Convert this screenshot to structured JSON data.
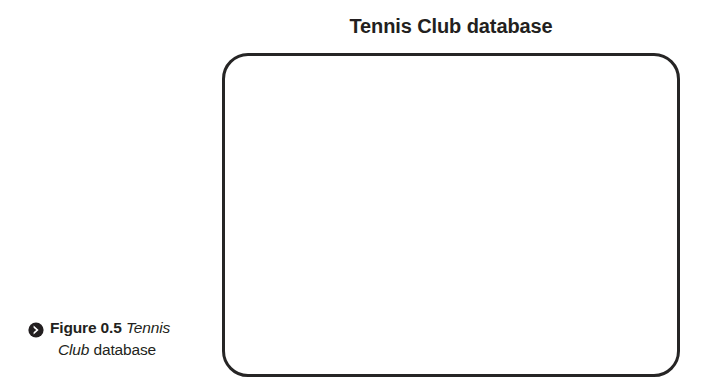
{
  "figure": {
    "title": "Tennis Club database",
    "frame": {
      "shape": "rounded-rectangle",
      "fill": "#ffffff",
      "stroke_color": "#262525",
      "stroke_width_px": 3.5,
      "corner_radius_px": 26,
      "contents": ""
    },
    "caption": {
      "icon": "chevron-right-circle-icon",
      "icon_color": "#231f20",
      "label": "Figure 0.5",
      "emphasis_1": "Tennis",
      "emphasis_2": "Club",
      "trailing": "database",
      "full_text": "Figure 0.5 Tennis Club database"
    }
  },
  "colors": {
    "page_background": "#ffffff",
    "text": "#231f20",
    "frame_stroke": "#262525"
  }
}
